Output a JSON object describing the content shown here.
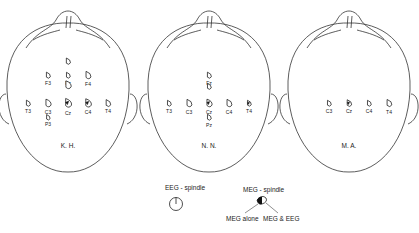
{
  "figure": {
    "subjects": [
      {
        "id": "KH",
        "label": "K. H.",
        "electrodes": [
          {
            "name": "",
            "gx": 0,
            "gy": -3,
            "type": "eeg",
            "dir": 0.7
          },
          {
            "name": "F3",
            "gx": -1,
            "gy": -2,
            "type": "eeg",
            "dir": 0.6
          },
          {
            "name": "Fz",
            "gx": 0,
            "gy": -2,
            "type": "eeg",
            "dir": 0.5
          },
          {
            "name": "F4",
            "gx": 1,
            "gy": -2,
            "type": "eeg",
            "dir": 1.2
          },
          {
            "name": "",
            "gx": 0,
            "gy": -1.3,
            "type": "eeg",
            "dir": 1.4
          },
          {
            "name": "T3",
            "gx": -2,
            "gy": 0,
            "type": "eeg",
            "dir": 0.6
          },
          {
            "name": "C3",
            "gx": -1,
            "gy": 0,
            "type": "eeg",
            "dir": 1.3
          },
          {
            "name": "Cz",
            "gx": 0,
            "gy": 0,
            "type": "meg-eeg",
            "dir": 1.8
          },
          {
            "name": "C4",
            "gx": 1,
            "gy": 0,
            "type": "meg-eeg",
            "dir": 1.6
          },
          {
            "name": "T4",
            "gx": 2,
            "gy": 0,
            "type": "eeg",
            "dir": 1.0
          },
          {
            "name": "P3",
            "gx": -1,
            "gy": 1,
            "type": "eeg",
            "dir": 0.3
          }
        ]
      },
      {
        "id": "NN",
        "label": "N. N.",
        "electrodes": [
          {
            "name": "Fz",
            "gx": 0,
            "gy": -2,
            "type": "eeg",
            "dir": 0.6
          },
          {
            "name": "",
            "gx": 0,
            "gy": -1.2,
            "type": "eeg",
            "dir": 0.5
          },
          {
            "name": "T3",
            "gx": -2,
            "gy": 0,
            "type": "eeg",
            "dir": 0.5
          },
          {
            "name": "C3",
            "gx": -1,
            "gy": 0,
            "type": "eeg",
            "dir": 1.2
          },
          {
            "name": "Cz",
            "gx": 0,
            "gy": 0,
            "type": "meg-eeg",
            "dir": 1.3
          },
          {
            "name": "C4",
            "gx": 1,
            "gy": 0,
            "type": "eeg",
            "dir": 1.2
          },
          {
            "name": "T4",
            "gx": 2,
            "gy": 0,
            "type": "meg-eeg",
            "dir": 0.5
          },
          {
            "name": "Pz",
            "gx": 0,
            "gy": 1,
            "type": "eeg-down",
            "dir": 0.5
          }
        ]
      },
      {
        "id": "MA",
        "label": "M. A.",
        "electrodes": [
          {
            "name": "C3",
            "gx": -1,
            "gy": 0,
            "type": "eeg",
            "dir": 0.5
          },
          {
            "name": "Cz",
            "gx": 0,
            "gy": 0,
            "type": "meg-eeg",
            "dir": 0.9
          },
          {
            "name": "C4",
            "gx": 1,
            "gy": 0,
            "type": "eeg",
            "dir": 0.5
          },
          {
            "name": "T4",
            "gx": 2,
            "gy": 0,
            "type": "eeg",
            "dir": 1.1
          }
        ]
      }
    ],
    "legend": {
      "eeg_title": "EEG - spindle",
      "meg_title": "MEG - spindle",
      "meg_alone": "MEG  alone",
      "meg_eeg": "MEG  &  EEG"
    }
  }
}
